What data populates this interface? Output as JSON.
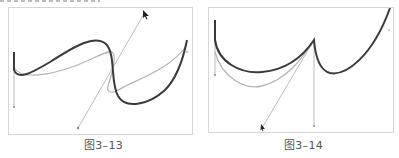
{
  "figures": [
    {
      "caption": "图3–13",
      "description": "S-shaped Bezier curve with gray original path and rotated handle line"
    },
    {
      "caption": "图3–14",
      "description": "Cusped Bezier curve with gray original path and handle lines"
    }
  ],
  "colors": {
    "curve": "#3a3a3a",
    "original_curve": "#b5b5b5",
    "handle_line": "#aaaaaa",
    "frame_border": "#d6d6d6",
    "caption_text": "#555555"
  }
}
